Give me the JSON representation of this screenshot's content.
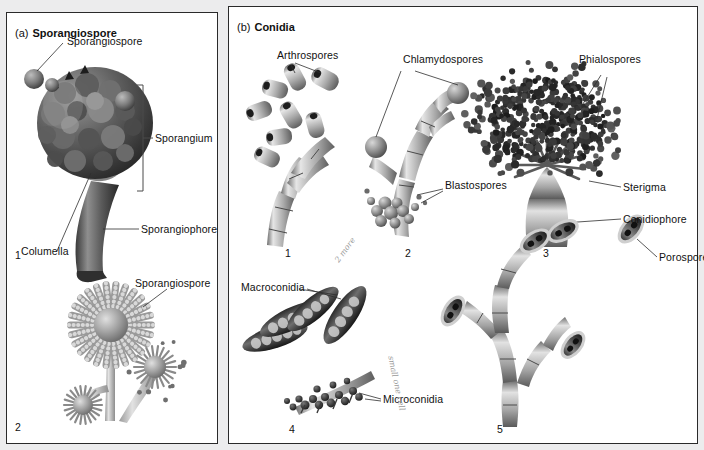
{
  "figure": {
    "panels": [
      {
        "tag": "(a)",
        "title": "Sporangiospore",
        "subfigures": [
          {
            "number": "1",
            "labels": [
              "Sporangiospore",
              "Sporangium",
              "Sporangiophore",
              "Columella"
            ]
          },
          {
            "number": "2",
            "labels": [
              "Sporangiospore"
            ]
          }
        ]
      },
      {
        "tag": "(b)",
        "title": "Conidia",
        "subfigures": [
          {
            "number": "1",
            "labels": [
              "Arthrospores"
            ]
          },
          {
            "number": "2",
            "labels": [
              "Chlamydospores",
              "Blastospores"
            ]
          },
          {
            "number": "3",
            "labels": [
              "Phialospores",
              "Sterigma",
              "Conidiophore"
            ]
          },
          {
            "number": "4",
            "labels": [
              "Macroconidia",
              "Microconidia"
            ]
          },
          {
            "number": "5",
            "labels": [
              "Porospore"
            ]
          }
        ]
      }
    ],
    "labels": {
      "a_tag": "(a)",
      "a_title": "Sporangiospore",
      "b_tag": "(b)",
      "b_title": "Conidia",
      "sporangiospore_top": "Sporangiospore",
      "sporangium": "Sporangium",
      "sporangiophore": "Sporangiophore",
      "columella": "Columella",
      "sporangiospore_lower": "Sporangiospore",
      "arthrospores": "Arthrospores",
      "chlamydospores": "Chlamydospores",
      "blastospores": "Blastospores",
      "phialospores": "Phialospores",
      "sterigma": "Sterigma",
      "conidiophore": "Conidiophore",
      "macroconidia": "Macroconidia",
      "microconidia": "Microconidia",
      "porospore": "Porospore"
    },
    "numbers": {
      "a1": "1",
      "a2": "2",
      "b1": "1",
      "b2": "2",
      "b3": "3",
      "b4": "4",
      "b5": "5"
    },
    "annotations": {
      "macro_note": "2 more",
      "micro_note": "small one cell"
    },
    "colors": {
      "panel_background": "#ffffff",
      "page_background": "#ececed",
      "border": "#2a2a2a",
      "text": "#111111",
      "leader_line": "#2f2f2f",
      "structure_dark": "#4a4a4a",
      "structure_mid": "#8d8d8d",
      "structure_light": "#d2d2d2",
      "handwriting": "#9a9a9a"
    }
  }
}
